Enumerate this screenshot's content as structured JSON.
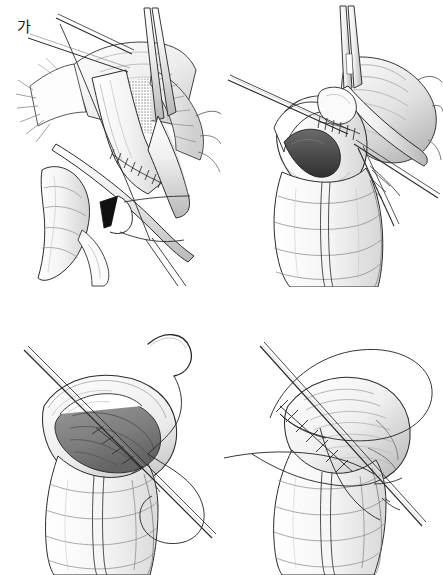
{
  "figure": {
    "kind": "medical-surgical-illustration",
    "style": "black-and-white pen-and-ink line drawing with graphite shading",
    "background_color": "#ffffff",
    "line_color": "#1a1a1a",
    "shade_light": "#e8e8e8",
    "shade_mid": "#c2c2c2",
    "shade_dark": "#8d8d8d",
    "lumen_dark": "#5e5e5e",
    "ink_black": "#111111",
    "layout": "2x2 grid of four unbordered panels on white",
    "columns": 2,
    "rows": 2,
    "panel_count": 4
  },
  "panels": [
    {
      "id": "a",
      "label": "가",
      "position": "top-left",
      "caption_text": "가",
      "subject": "linear stapler applied across bowel with mesenteric window",
      "elements": [
        "two fine instrument shafts entering from upper left",
        "grasper shaft descending from top right",
        "stapled bowel segment with staple-line hatch marks",
        "stippled halftone triangular mesenteric window",
        "fringed mesenteric fat edge",
        "solid black wedge marking enterotomy opening",
        "haustrated small bowel loop descending lower left",
        "suture strand trailing to the right"
      ]
    },
    {
      "id": "b",
      "label": "나",
      "position": "top-right",
      "caption_text": "나",
      "subject": "enterotomy opened, stapler jaw inserted into both lumens",
      "elements": [
        "stapler shaft entering from top",
        "fine needle driver shaft from upper left",
        "open bowel lumen with dark interior",
        "transverse staple line hatch marks",
        "mesenteric fat fan to the right",
        "two crossing instrument shafts at lower right",
        "parallel bowel limbs descending below"
      ]
    },
    {
      "id": "c",
      "label": "다",
      "position": "bottom-left",
      "caption_text": "다",
      "subject": "common enterotomy held open, running suture begun",
      "elements": [
        "needle holder shaft from upper left",
        "curved suture needle at top right",
        "long looping suture thread",
        "open enterotomy with gray shaded mucosal lumen",
        "running suture bites along the cut edge",
        "everted bowel wall rim",
        "haustrated bowel trunk below"
      ]
    },
    {
      "id": "d",
      "label": "라",
      "position": "bottom-right",
      "caption_text": "라",
      "subject": "enterotomy closed with continuous suture line",
      "elements": [
        "needle holder shaft from upper left",
        "large suture thread loop arcing over the top",
        "free suture tail extending to the left",
        "continuous closure suture line with knots",
        "closed bowel stump bulging to the right",
        "haustrated bowel trunk below",
        "needle exiting at lower right"
      ]
    }
  ]
}
